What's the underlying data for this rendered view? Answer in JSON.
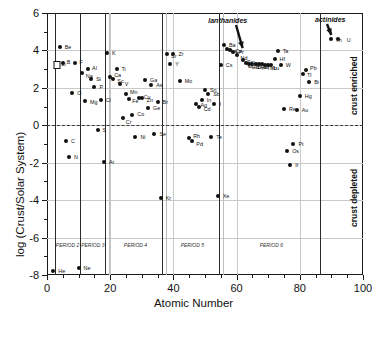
{
  "chart_data": {
    "type": "scatter",
    "title": "",
    "xlabel": "Atomic Number",
    "ylabel": "log (Crust/Solar System)",
    "xlim": [
      0,
      100
    ],
    "ylim": [
      -8,
      6
    ],
    "xticks": [
      0,
      20,
      40,
      60,
      80,
      100
    ],
    "yticks": [
      6,
      4,
      2,
      0,
      -2,
      -4,
      -6,
      -8
    ],
    "grid": true,
    "legend": "none",
    "reference_line": {
      "y": 0,
      "style": "dashed"
    },
    "points": [
      {
        "label": "He",
        "x": 2,
        "y": -7.8
      },
      {
        "label": "Li",
        "x": 3,
        "y": 3.3,
        "marker": "square"
      },
      {
        "label": "Be",
        "x": 4,
        "y": 4.2
      },
      {
        "label": "B",
        "x": 5,
        "y": 3.35
      },
      {
        "label": "C",
        "x": 6,
        "y": -0.85
      },
      {
        "label": "N",
        "x": 7,
        "y": -1.7
      },
      {
        "label": "O",
        "x": 8,
        "y": 1.7
      },
      {
        "label": "F",
        "x": 9,
        "y": 3.35
      },
      {
        "label": "Ne",
        "x": 10,
        "y": -7.6
      },
      {
        "label": "Na",
        "x": 11,
        "y": 2.8
      },
      {
        "label": "Mg",
        "x": 12,
        "y": 1.3
      },
      {
        "label": "Al",
        "x": 13,
        "y": 3.0
      },
      {
        "label": "Si",
        "x": 14,
        "y": 2.5
      },
      {
        "label": "P",
        "x": 15,
        "y": 2.05
      },
      {
        "label": "S",
        "x": 16,
        "y": -0.25
      },
      {
        "label": "Cl",
        "x": 17,
        "y": 1.35
      },
      {
        "label": "Ar",
        "x": 18,
        "y": -1.95
      },
      {
        "label": "K",
        "x": 19,
        "y": 3.85
      },
      {
        "label": "Ca",
        "x": 20,
        "y": 2.6
      },
      {
        "label": "Sc",
        "x": 21,
        "y": 2.45
      },
      {
        "label": "Ti",
        "x": 22,
        "y": 3.0
      },
      {
        "label": "V",
        "x": 23,
        "y": 2.2
      },
      {
        "label": "Cr",
        "x": 24,
        "y": 0.4
      },
      {
        "label": "Mn",
        "x": 25,
        "y": 1.65
      },
      {
        "label": "Fe",
        "x": 26,
        "y": 1.4
      },
      {
        "label": "Co",
        "x": 27,
        "y": 0.55
      },
      {
        "label": "Ni",
        "x": 28,
        "y": -0.6
      },
      {
        "label": "Cu",
        "x": 29,
        "y": 1.45
      },
      {
        "label": "Zn",
        "x": 30,
        "y": 1.45
      },
      {
        "label": "Ga",
        "x": 31,
        "y": 2.4
      },
      {
        "label": "Ge",
        "x": 32,
        "y": 0.9
      },
      {
        "label": "As",
        "x": 33,
        "y": 2.15
      },
      {
        "label": "Se",
        "x": 34,
        "y": -0.45
      },
      {
        "label": "Br",
        "x": 35,
        "y": 1.25
      },
      {
        "label": "Kr",
        "x": 36,
        "y": -3.9
      },
      {
        "label": "Sr",
        "x": 38,
        "y": 3.8
      },
      {
        "label": "Y",
        "x": 39,
        "y": 3.25
      },
      {
        "label": "Zr",
        "x": 40,
        "y": 3.8
      },
      {
        "label": "Mo",
        "x": 42,
        "y": 2.35
      },
      {
        "label": "Rh",
        "x": 45,
        "y": -0.7
      },
      {
        "label": "Pd",
        "x": 46,
        "y": -0.85
      },
      {
        "label": "Ag",
        "x": 47,
        "y": 1.15
      },
      {
        "label": "Cd",
        "x": 48,
        "y": 1.0
      },
      {
        "label": "In",
        "x": 49,
        "y": 1.35
      },
      {
        "label": "Sn",
        "x": 50,
        "y": 1.9
      },
      {
        "label": "Sb",
        "x": 51,
        "y": 1.65
      },
      {
        "label": "Te",
        "x": 52,
        "y": -0.6
      },
      {
        "label": "I",
        "x": 53,
        "y": 1.15
      },
      {
        "label": "Xe",
        "x": 54,
        "y": -3.8
      },
      {
        "label": "Cs",
        "x": 55,
        "y": 3.2
      },
      {
        "label": "Ba",
        "x": 56,
        "y": 4.3
      },
      {
        "label": "La",
        "x": 57,
        "y": 4.05
      },
      {
        "label": "Ce",
        "x": 58,
        "y": 4.0
      },
      {
        "label": "Pr",
        "x": 59,
        "y": 3.9
      },
      {
        "label": "Nd",
        "x": 60,
        "y": 3.75
      },
      {
        "label": "Sm",
        "x": 62,
        "y": 3.5
      },
      {
        "label": "Eu",
        "x": 63,
        "y": 3.35
      },
      {
        "label": "Gd",
        "x": 64,
        "y": 3.3
      },
      {
        "label": "Tb",
        "x": 65,
        "y": 3.3
      },
      {
        "label": "Dy",
        "x": 66,
        "y": 3.25
      },
      {
        "label": "Ho",
        "x": 67,
        "y": 3.25
      },
      {
        "label": "Er",
        "x": 68,
        "y": 3.25
      },
      {
        "label": "Tm",
        "x": 69,
        "y": 3.2
      },
      {
        "label": "Yb",
        "x": 70,
        "y": 3.2
      },
      {
        "label": "Lu",
        "x": 71,
        "y": 3.2
      },
      {
        "label": "Hf",
        "x": 72,
        "y": 3.55
      },
      {
        "label": "Ta",
        "x": 73,
        "y": 3.95
      },
      {
        "label": "W",
        "x": 74,
        "y": 3.2
      },
      {
        "label": "Re",
        "x": 75,
        "y": 0.85
      },
      {
        "label": "Os",
        "x": 76,
        "y": -1.4
      },
      {
        "label": "Ir",
        "x": 77,
        "y": -2.1
      },
      {
        "label": "Pt",
        "x": 78,
        "y": -1.0
      },
      {
        "label": "Au",
        "x": 79,
        "y": 0.8
      },
      {
        "label": "Hg",
        "x": 80,
        "y": 1.55
      },
      {
        "label": "Tl",
        "x": 81,
        "y": 2.75
      },
      {
        "label": "Pb",
        "x": 82,
        "y": 2.95
      },
      {
        "label": "Bi",
        "x": 83,
        "y": 2.3
      },
      {
        "label": "Th",
        "x": 90,
        "y": 4.6
      },
      {
        "label": "U",
        "x": 92,
        "y": 4.6
      }
    ],
    "period_dividers": [
      2.5,
      10.5,
      18.3,
      19.6,
      36.3,
      37.6,
      54.3,
      55.6,
      86.3
    ],
    "periods": [
      {
        "label": "PERIOD 2",
        "x_center": 6.5
      },
      {
        "label": "PERIOD 3",
        "x_center": 14.5
      },
      {
        "label": "PERIOD 4",
        "x_center": 28
      },
      {
        "label": "PERIOD 5",
        "x_center": 46
      },
      {
        "label": "PERIOD 6",
        "x_center": 71
      }
    ],
    "annotations": [
      {
        "text": "lanthanides",
        "x": 58,
        "y": 5.55,
        "arrow_to_x": 62,
        "arrow_to_y": 4.1
      },
      {
        "text": "actinides",
        "x": 88,
        "y": 5.6,
        "arrow_to_x": 90,
        "arrow_to_y": 4.8
      }
    ],
    "region_labels": [
      {
        "text": "crust enriched",
        "y_center": 2.6
      },
      {
        "text": "crust depleted",
        "y_center": -3.4
      }
    ]
  },
  "colors": {
    "axis": "#1a1a1a",
    "grid": "#c9c9c9",
    "marker": "#111111",
    "period_line": "#2b2b2b",
    "zero_line": "#3a3a3a"
  }
}
